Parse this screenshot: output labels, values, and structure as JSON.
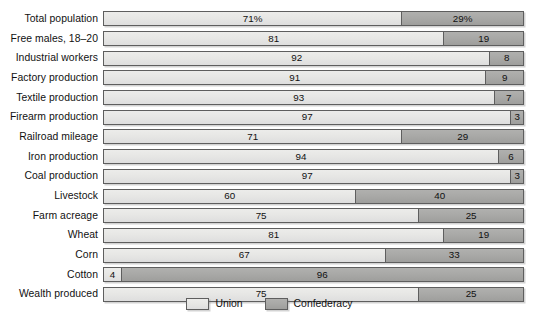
{
  "chart_data": {
    "type": "bar",
    "subtype": "stacked-horizontal-100pct",
    "title": "",
    "xlabel": "",
    "ylabel": "",
    "xlim": [
      0,
      100
    ],
    "grid": false,
    "legend_position": "bottom-center",
    "categories": [
      "Total population",
      "Free males, 18–20",
      "Industrial workers",
      "Factory production",
      "Textile production",
      "Firearm production",
      "Railroad mileage",
      "Iron production",
      "Coal production",
      "Livestock",
      "Farm acreage",
      "Wheat",
      "Corn",
      "Cotton",
      "Wealth produced"
    ],
    "series": [
      {
        "name": "Union",
        "color": "#e6e6e4",
        "values": [
          71,
          81,
          92,
          91,
          93,
          97,
          71,
          94,
          97,
          60,
          75,
          81,
          67,
          4,
          75
        ],
        "labels": [
          "71%",
          "81",
          "92",
          "91",
          "93",
          "97",
          "71",
          "94",
          "97",
          "60",
          "75",
          "81",
          "67",
          "4",
          "75"
        ]
      },
      {
        "name": "Confederacy",
        "color": "#a8a8a6",
        "values": [
          29,
          19,
          8,
          9,
          7,
          3,
          29,
          6,
          3,
          40,
          25,
          19,
          33,
          96,
          25
        ],
        "labels": [
          "29%",
          "19",
          "8",
          "9",
          "7",
          "3",
          "29",
          "6",
          "3",
          "40",
          "25",
          "19",
          "33",
          "96",
          "25"
        ]
      }
    ]
  },
  "legend": {
    "items": [
      {
        "label": "Union",
        "swatch": "light-gray-swatch"
      },
      {
        "label": "Confederacy",
        "swatch": "dark-gray-swatch"
      }
    ]
  },
  "caption": {
    "text": ""
  }
}
